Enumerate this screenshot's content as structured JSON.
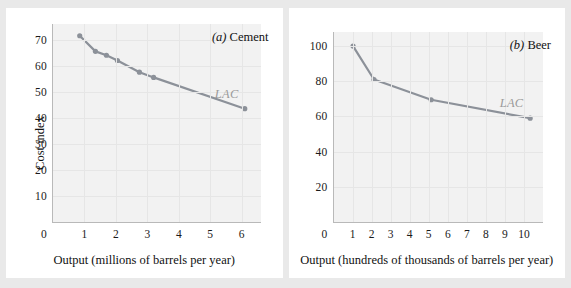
{
  "figure": {
    "background_color": "#e9e9e9",
    "panel_color": "#ffffff",
    "plot_area_color": "#f2f2f2",
    "curve_color": "#8c9199",
    "lac_label_color": "#9a9a9a"
  },
  "chart_data": [
    {
      "type": "line",
      "title": "(a) Cement",
      "title_prefix": "(a)",
      "title_text": "Cement",
      "xlabel": "Output (millions of barrels per year)",
      "ylabel": "Cost index",
      "series_label": "LAC",
      "xlim": [
        0,
        6.6
      ],
      "ylim": [
        0,
        76
      ],
      "xticks": [
        0,
        1,
        2,
        3,
        4,
        5,
        6
      ],
      "yticks": [
        10,
        20,
        30,
        40,
        50,
        60,
        70
      ],
      "grid": true,
      "legend": "none",
      "x": [
        0.85,
        1.35,
        1.7,
        2.05,
        2.75,
        3.2,
        6.1
      ],
      "y": [
        71.5,
        65.5,
        64.0,
        62.0,
        57.5,
        55.5,
        43.5
      ],
      "points": [
        {
          "x": 0.85,
          "y": 71.5
        },
        {
          "x": 1.35,
          "y": 65.5
        },
        {
          "x": 1.7,
          "y": 64.0
        },
        {
          "x": 2.05,
          "y": 62.0
        },
        {
          "x": 2.75,
          "y": 57.5
        },
        {
          "x": 3.2,
          "y": 55.5
        },
        {
          "x": 6.1,
          "y": 43.5
        }
      ]
    },
    {
      "type": "line",
      "title": "(b) Beer",
      "title_prefix": "(b)",
      "title_text": "Beer",
      "xlabel": "Output (hundreds of thousands of barrels per year)",
      "ylabel": "",
      "series_label": "LAC",
      "xlim": [
        0,
        11
      ],
      "ylim": [
        0,
        108
      ],
      "xticks": [
        0,
        1,
        2,
        3,
        4,
        5,
        6,
        7,
        8,
        9,
        10
      ],
      "yticks": [
        20,
        40,
        60,
        80,
        100
      ],
      "grid": true,
      "legend": "none",
      "x": [
        1.0,
        2.1,
        5.1,
        10.3
      ],
      "y": [
        100.0,
        81.0,
        69.5,
        59.0
      ],
      "points": [
        {
          "x": 1.0,
          "y": 100.0
        },
        {
          "x": 2.1,
          "y": 81.0
        },
        {
          "x": 5.1,
          "y": 69.5
        },
        {
          "x": 10.3,
          "y": 59.0
        }
      ]
    }
  ]
}
